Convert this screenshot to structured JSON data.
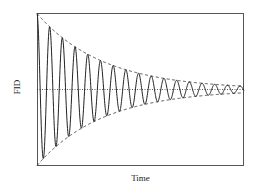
{
  "chart_data": {
    "type": "line",
    "title": "",
    "xlabel": "Time",
    "ylabel": "FID",
    "grid": false,
    "legend": null,
    "axis_ticks": false,
    "series": [
      {
        "name": "FID signal",
        "style": "solid",
        "function": "A0 * exp(-t/tau) * cos(2*pi*t/period)",
        "params": {
          "A0": 1.0,
          "tau": 0.32,
          "period": 0.0613,
          "t_range": [
            0,
            1
          ]
        },
        "approx_peak_values": [
          1.0,
          0.82,
          0.67,
          0.55,
          0.45,
          0.37,
          0.3,
          0.25,
          0.21,
          0.17,
          0.14,
          0.11,
          0.09,
          0.08,
          0.06,
          0.05,
          0.04
        ]
      },
      {
        "name": "upper envelope",
        "style": "dashed",
        "function": "exp(-t/tau)"
      },
      {
        "name": "lower envelope",
        "style": "dashed",
        "function": "-exp(-t/tau)"
      },
      {
        "name": "baseline",
        "style": "dotted",
        "function": "0"
      }
    ],
    "xlim": [
      0,
      1
    ],
    "ylim": [
      -1,
      1
    ]
  },
  "layout": {
    "plot_box": {
      "x0": 37,
      "y0": 13,
      "x1": 244,
      "y1": 166
    },
    "zero_y": 89.5,
    "amp_px": 76,
    "tau_px": 66,
    "period_px": 12.7
  },
  "colors": {
    "line": "#222222",
    "frame": "#555555",
    "background": "#ffffff"
  }
}
